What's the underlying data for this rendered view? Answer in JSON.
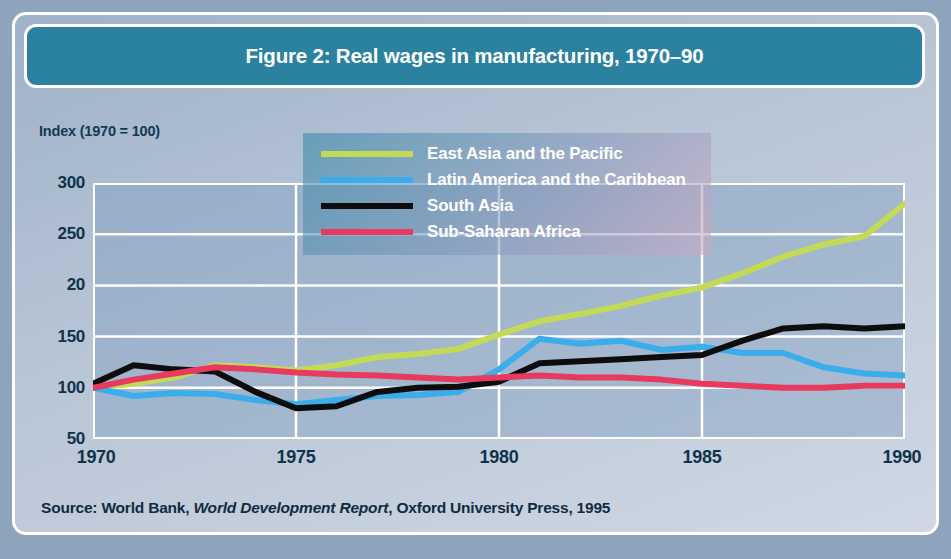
{
  "figure": {
    "title": "Figure 2: Real wages in manufacturing, 1970–90",
    "axis_caption": "Index (1970 = 100)",
    "source_prefix": "Source: World Bank, ",
    "source_italic": "World Development Report",
    "source_suffix": ", Oxford University Press, 1995"
  },
  "colors": {
    "header_bar": "#2a82a0",
    "card_background": "#b9c6d6",
    "page_background": "#8ea4bd",
    "frame": "#ffffff",
    "east_asia": "#c3da57",
    "latin_america": "#3badea",
    "south_asia": "#0d0d0d",
    "sub_saharan_africa": "#e8395f",
    "tick_text": "#10324a"
  },
  "legend": {
    "entries": [
      {
        "label": "East Asia and the Pacific",
        "color": "#c3da57"
      },
      {
        "label": "Latin America and the Caribbean",
        "color": "#3badea"
      },
      {
        "label": "South Asia",
        "color": "#0d0d0d"
      },
      {
        "label": "Sub-Saharan Africa",
        "color": "#e8395f"
      }
    ]
  },
  "chart_data": {
    "type": "line",
    "title": "Figure 2: Real wages in manufacturing, 1970–90",
    "xlabel": "",
    "ylabel": "Index (1970 = 100)",
    "xlim": [
      1970,
      1990
    ],
    "ylim": [
      50,
      300
    ],
    "ytick_labels": [
      "300",
      "250",
      "20",
      "150",
      "100",
      "50"
    ],
    "ytick_values": [
      300,
      250,
      200,
      150,
      100,
      50
    ],
    "xtick_labels": [
      "1970",
      "1975",
      "1980",
      "1985",
      "1990"
    ],
    "xtick_values": [
      1970,
      1975,
      1980,
      1985,
      1990
    ],
    "grid": true,
    "legend_position": "upper center",
    "x": [
      1970,
      1971,
      1972,
      1973,
      1974,
      1975,
      1976,
      1977,
      1978,
      1979,
      1980,
      1981,
      1982,
      1983,
      1984,
      1985,
      1986,
      1987,
      1988,
      1989,
      1990
    ],
    "series": [
      {
        "name": "East Asia and the Pacific",
        "color": "#c3da57",
        "values": [
          100,
          104,
          110,
          122,
          120,
          117,
          122,
          130,
          133,
          138,
          152,
          165,
          172,
          180,
          190,
          198,
          212,
          228,
          240,
          248,
          280
        ]
      },
      {
        "name": "Latin America and the Caribbean",
        "color": "#3badea",
        "values": [
          100,
          92,
          95,
          94,
          88,
          84,
          88,
          92,
          93,
          96,
          118,
          148,
          143,
          146,
          137,
          140,
          134,
          134,
          120,
          114,
          112
        ]
      },
      {
        "name": "South Asia",
        "color": "#0d0d0d",
        "values": [
          104,
          122,
          118,
          116,
          96,
          80,
          82,
          96,
          100,
          101,
          106,
          124,
          126,
          128,
          130,
          132,
          146,
          158,
          160,
          158,
          160
        ]
      },
      {
        "name": "Sub-Saharan Africa",
        "color": "#e8395f",
        "values": [
          100,
          108,
          114,
          120,
          118,
          115,
          113,
          112,
          110,
          108,
          110,
          112,
          110,
          110,
          108,
          104,
          102,
          100,
          100,
          102,
          102
        ]
      }
    ]
  }
}
